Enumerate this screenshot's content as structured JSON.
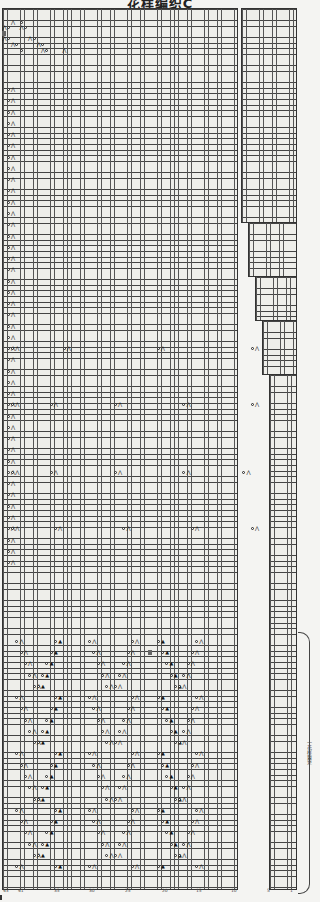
{
  "title": "花样编织C",
  "bracket_label": "一花样重复",
  "legend_symbols": {
    "yarn_over": "○",
    "k2tog": "⋀",
    "ssk": "⋀",
    "center_double_dec": "▲",
    "no_stitch": "■"
  },
  "main_chart": {
    "x": 2,
    "y": 8,
    "width": 236,
    "height": 882
  },
  "right_panel": {
    "segments": [
      {
        "x": 241,
        "y": 8,
        "width": 56,
        "height": 215
      },
      {
        "x": 248,
        "y": 222,
        "width": 49,
        "height": 55
      },
      {
        "x": 255,
        "y": 276,
        "width": 42,
        "height": 45
      },
      {
        "x": 262,
        "y": 320,
        "width": 35,
        "height": 55
      },
      {
        "x": 269,
        "y": 374,
        "width": 28,
        "height": 516
      }
    ],
    "decrease_marks": [
      "⌐",
      "⌐",
      "⌐",
      "⌐",
      "⌐",
      "⌐"
    ]
  },
  "row_numbers": [
    "70",
    "",
    "65",
    "",
    "60",
    "",
    "55",
    "",
    "50",
    "",
    "45",
    "40",
    "35",
    "30",
    "25",
    "20",
    "15",
    "10",
    "5",
    "1"
  ],
  "column_numbers": [
    "43",
    "41",
    "35",
    "30",
    "25",
    "20",
    "15",
    "10",
    "5",
    "1"
  ],
  "chart_rows_visible": 157,
  "colors": {
    "grid_line": "#444444",
    "cell_bg": "#eeeeea",
    "page_bg": "#f4f4f2",
    "shaded_cell": "#666666"
  }
}
